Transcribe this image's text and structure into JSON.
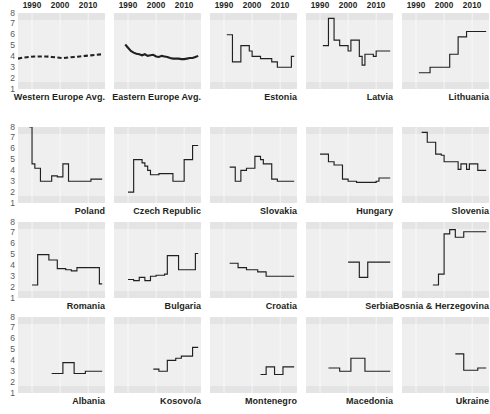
{
  "figure": {
    "kind": "small-multiples-line-chart-grid",
    "rows": 4,
    "columns": 5
  },
  "axes": {
    "y_ticks": [
      "8",
      "7",
      "6",
      "5",
      "4",
      "3",
      "2",
      "1"
    ],
    "y_min": 1,
    "y_max": 8,
    "x_ticks": [
      "1990",
      "2000",
      "2010"
    ],
    "x_min": 1985,
    "x_max": 2016
  },
  "chart_data": {
    "type": "line",
    "title": "",
    "subtitle": "",
    "xlabel": "",
    "ylabel": "",
    "xlim": [
      1985,
      2016
    ],
    "ylim": [
      1,
      8
    ],
    "grid": true,
    "legend": "none",
    "xticks": [
      1990,
      2000,
      2010
    ],
    "yticks": [
      1,
      2,
      3,
      4,
      5,
      6,
      7,
      8
    ],
    "panel_layout": [
      [
        "Western Europe Avg.",
        "Eastern Europe Avg.",
        "Estonia",
        "Latvia",
        "Lithuania"
      ],
      [
        "Poland",
        "Czech Republic",
        "Slovakia",
        "Hungary",
        "Slovenia"
      ],
      [
        "Romania",
        "Bulgaria",
        "Croatia",
        "Serbia",
        "Bosnia & Herzegovina"
      ],
      [
        "Albania",
        "Kosovo/a",
        "Montenegro",
        "Macedonia",
        "Ukraine"
      ]
    ],
    "panels": [
      {
        "name": "Western Europe Avg.",
        "style": "dashed",
        "x": [
          1985,
          1987,
          1989,
          1991,
          1993,
          1995,
          1997,
          1999,
          2001,
          2003,
          2005,
          2007,
          2009,
          2011,
          2013,
          2015
        ],
        "values": [
          3.8,
          3.9,
          3.95,
          4.0,
          4.0,
          4.0,
          3.95,
          3.9,
          3.85,
          3.9,
          3.95,
          4.0,
          4.05,
          4.1,
          4.15,
          4.2
        ]
      },
      {
        "name": "Eastern Europe Avg.",
        "style": "thick",
        "x": [
          1989,
          1990,
          1991,
          1992,
          1993,
          1994,
          1995,
          1996,
          1997,
          1998,
          1999,
          2000,
          2001,
          2002,
          2003,
          2004,
          2005,
          2006,
          2007,
          2008,
          2009,
          2010,
          2011,
          2012,
          2013,
          2014,
          2015
        ],
        "values": [
          5.1,
          4.8,
          4.5,
          4.35,
          4.25,
          4.2,
          4.1,
          4.2,
          4.05,
          4.1,
          4.15,
          4.0,
          3.95,
          4.05,
          4.0,
          3.95,
          3.85,
          3.8,
          3.8,
          3.8,
          3.75,
          3.75,
          3.8,
          3.85,
          3.85,
          3.95,
          4.05
        ]
      },
      {
        "name": "Estonia",
        "style": "thin",
        "x": [
          1991,
          1992,
          1993,
          1994,
          1995,
          1996,
          1997,
          1998,
          1999,
          2000,
          2001,
          2002,
          2003,
          2004,
          2005,
          2006,
          2007,
          2008,
          2009,
          2010,
          2011,
          2012,
          2013,
          2014,
          2015
        ],
        "values": [
          6.0,
          6.0,
          3.5,
          3.5,
          3.5,
          5.0,
          5.0,
          5.0,
          4.5,
          4.0,
          4.0,
          4.0,
          3.8,
          3.8,
          3.8,
          3.8,
          3.5,
          3.5,
          3.0,
          3.0,
          3.0,
          3.0,
          3.0,
          4.0,
          4.0
        ]
      },
      {
        "name": "Latvia",
        "style": "thin",
        "x": [
          1991,
          1992,
          1993,
          1994,
          1995,
          1996,
          1997,
          1998,
          1999,
          2000,
          2001,
          2002,
          2003,
          2004,
          2005,
          2006,
          2007,
          2008,
          2009,
          2010,
          2011,
          2012,
          2013,
          2014,
          2015
        ],
        "values": [
          5.0,
          5.0,
          7.5,
          7.5,
          5.5,
          5.5,
          5.0,
          5.0,
          5.0,
          4.5,
          5.5,
          5.5,
          5.5,
          4.0,
          3.2,
          4.2,
          4.2,
          4.2,
          4.0,
          4.5,
          4.5,
          4.5,
          4.5,
          4.5,
          4.5
        ]
      },
      {
        "name": "Lithuania",
        "style": "thin",
        "x": [
          1991,
          1992,
          1993,
          1994,
          1995,
          1996,
          1997,
          1998,
          1999,
          2000,
          2001,
          2002,
          2003,
          2004,
          2005,
          2006,
          2007,
          2008,
          2009,
          2010,
          2011,
          2012,
          2013,
          2014,
          2015
        ],
        "values": [
          2.5,
          2.5,
          2.5,
          2.5,
          3.0,
          3.0,
          3.0,
          3.0,
          3.0,
          3.0,
          3.0,
          4.2,
          4.2,
          4.2,
          5.8,
          5.8,
          5.8,
          6.3,
          6.3,
          6.3,
          6.3,
          6.3,
          6.3,
          6.3,
          6.3
        ]
      },
      {
        "name": "Poland",
        "style": "thin",
        "x": [
          1989,
          1990,
          1991,
          1992,
          1993,
          1994,
          1995,
          1996,
          1997,
          1998,
          1999,
          2000,
          2001,
          2002,
          2003,
          2004,
          2005,
          2006,
          2007,
          2008,
          2009,
          2010,
          2011,
          2012,
          2013,
          2014,
          2015
        ],
        "values": [
          8.0,
          4.6,
          4.2,
          4.2,
          3.0,
          3.0,
          3.0,
          3.0,
          3.5,
          3.5,
          3.4,
          3.4,
          4.6,
          4.6,
          3.0,
          3.0,
          3.0,
          3.0,
          3.0,
          3.0,
          3.0,
          3.0,
          3.2,
          3.2,
          3.2,
          3.2,
          3.2
        ]
      },
      {
        "name": "Czech Republic",
        "style": "thin",
        "x": [
          1990,
          1991,
          1992,
          1993,
          1994,
          1995,
          1996,
          1997,
          1998,
          1999,
          2000,
          2001,
          2002,
          2003,
          2004,
          2005,
          2006,
          2007,
          2008,
          2009,
          2010,
          2011,
          2012,
          2013,
          2014,
          2015
        ],
        "values": [
          2.0,
          2.0,
          5.0,
          5.0,
          5.0,
          4.7,
          4.4,
          4.0,
          3.6,
          3.6,
          3.6,
          3.7,
          3.7,
          3.7,
          3.7,
          3.7,
          3.0,
          3.0,
          3.0,
          3.0,
          5.0,
          5.0,
          5.0,
          6.3,
          6.3,
          6.3
        ]
      },
      {
        "name": "Slovakia",
        "style": "thin",
        "x": [
          1992,
          1993,
          1994,
          1995,
          1996,
          1997,
          1998,
          1999,
          2000,
          2001,
          2002,
          2003,
          2004,
          2005,
          2006,
          2007,
          2008,
          2009,
          2010,
          2011,
          2012,
          2013,
          2014,
          2015
        ],
        "values": [
          4.3,
          4.3,
          3.0,
          3.0,
          4.0,
          4.0,
          4.2,
          4.2,
          4.2,
          5.3,
          5.3,
          5.0,
          4.6,
          4.6,
          4.6,
          3.2,
          3.2,
          3.0,
          3.0,
          3.0,
          3.0,
          3.0,
          3.0,
          3.0
        ]
      },
      {
        "name": "Hungary",
        "style": "thin",
        "x": [
          1990,
          1991,
          1992,
          1993,
          1994,
          1995,
          1996,
          1997,
          1998,
          1999,
          2000,
          2001,
          2002,
          2003,
          2004,
          2005,
          2006,
          2007,
          2008,
          2009,
          2010,
          2011,
          2012,
          2013,
          2014,
          2015
        ],
        "values": [
          5.5,
          5.5,
          5.5,
          4.8,
          4.8,
          4.5,
          4.5,
          4.5,
          3.2,
          3.2,
          3.0,
          3.0,
          3.0,
          2.9,
          2.9,
          2.9,
          2.9,
          2.9,
          2.9,
          2.9,
          3.0,
          3.3,
          3.3,
          3.3,
          3.3,
          3.3
        ]
      },
      {
        "name": "Slovenia",
        "style": "thin",
        "x": [
          1992,
          1993,
          1994,
          1995,
          1996,
          1997,
          1998,
          1999,
          2000,
          2001,
          2002,
          2003,
          2004,
          2005,
          2006,
          2007,
          2008,
          2009,
          2010,
          2011,
          2012,
          2013,
          2014,
          2015
        ],
        "values": [
          7.5,
          7.5,
          6.6,
          6.6,
          6.6,
          5.5,
          5.5,
          5.4,
          4.8,
          4.8,
          4.8,
          4.8,
          4.8,
          4.1,
          4.6,
          4.6,
          4.1,
          4.6,
          4.6,
          4.6,
          4.0,
          4.0,
          4.0,
          4.0
        ]
      },
      {
        "name": "Romania",
        "style": "thin",
        "x": [
          1990,
          1991,
          1992,
          1993,
          1994,
          1995,
          1996,
          1997,
          1998,
          1999,
          2000,
          2001,
          2002,
          2003,
          2004,
          2005,
          2006,
          2007,
          2008,
          2009,
          2010,
          2011,
          2012,
          2013,
          2014,
          2015
        ],
        "values": [
          2.2,
          2.2,
          5.0,
          5.0,
          5.0,
          5.0,
          4.5,
          4.5,
          4.5,
          3.7,
          3.7,
          3.7,
          3.6,
          3.6,
          3.5,
          3.5,
          3.8,
          3.8,
          3.8,
          3.8,
          3.8,
          3.8,
          3.8,
          3.8,
          2.3,
          2.3
        ]
      },
      {
        "name": "Bulgaria",
        "style": "thin",
        "x": [
          1990,
          1991,
          1992,
          1993,
          1994,
          1995,
          1996,
          1997,
          1998,
          1999,
          2000,
          2001,
          2002,
          2003,
          2004,
          2005,
          2006,
          2007,
          2008,
          2009,
          2010,
          2011,
          2012,
          2013,
          2014,
          2015
        ],
        "values": [
          2.7,
          2.7,
          2.6,
          2.6,
          2.9,
          2.9,
          2.6,
          2.6,
          3.0,
          3.0,
          3.1,
          3.1,
          3.1,
          3.2,
          4.9,
          4.9,
          4.9,
          4.9,
          3.6,
          3.6,
          3.6,
          3.6,
          3.6,
          3.6,
          5.1,
          5.1
        ]
      },
      {
        "name": "Croatia",
        "style": "thin",
        "x": [
          1992,
          1993,
          1994,
          1995,
          1996,
          1997,
          1998,
          1999,
          2000,
          2001,
          2002,
          2003,
          2004,
          2005,
          2006,
          2007,
          2008,
          2009,
          2010,
          2011,
          2012,
          2013,
          2014,
          2015
        ],
        "values": [
          4.2,
          4.2,
          4.2,
          3.8,
          3.8,
          3.8,
          3.6,
          3.6,
          3.6,
          3.6,
          3.4,
          3.4,
          3.4,
          3.0,
          3.0,
          3.0,
          3.0,
          3.0,
          3.0,
          3.0,
          3.0,
          3.0,
          3.0,
          3.0
        ]
      },
      {
        "name": "Serbia",
        "style": "thin",
        "x": [
          2000,
          2001,
          2002,
          2003,
          2004,
          2005,
          2006,
          2007,
          2008,
          2009,
          2010,
          2011,
          2012,
          2013,
          2014,
          2015
        ],
        "values": [
          4.3,
          4.3,
          4.3,
          4.3,
          2.9,
          2.9,
          2.9,
          4.3,
          4.3,
          4.3,
          4.3,
          4.3,
          4.3,
          4.3,
          4.3,
          4.3
        ]
      },
      {
        "name": "Bosnia & Herzegovina",
        "style": "thin",
        "x": [
          1996,
          1997,
          1998,
          1999,
          2000,
          2001,
          2002,
          2003,
          2004,
          2005,
          2006,
          2007,
          2008,
          2009,
          2010,
          2011,
          2012,
          2013,
          2014,
          2015
        ],
        "values": [
          2.2,
          2.2,
          3.2,
          3.2,
          6.9,
          6.9,
          7.3,
          7.3,
          6.6,
          6.6,
          6.6,
          7.1,
          7.1,
          7.1,
          7.1,
          7.1,
          7.1,
          7.1,
          7.1,
          7.1
        ]
      },
      {
        "name": "Albania",
        "style": "thin",
        "x": [
          1997,
          1998,
          1999,
          2000,
          2001,
          2002,
          2003,
          2004,
          2005,
          2006,
          2007,
          2008,
          2009,
          2010,
          2011,
          2012,
          2013,
          2014,
          2015
        ],
        "values": [
          2.8,
          2.8,
          2.8,
          2.8,
          3.8,
          3.8,
          3.8,
          3.8,
          2.8,
          2.8,
          2.8,
          2.8,
          3.0,
          3.0,
          3.0,
          3.0,
          3.0,
          3.0,
          3.0
        ]
      },
      {
        "name": "Kosovo/a",
        "style": "thin",
        "x": [
          1999,
          2000,
          2001,
          2002,
          2003,
          2004,
          2005,
          2006,
          2007,
          2008,
          2009,
          2010,
          2011,
          2012,
          2013,
          2014,
          2015
        ],
        "values": [
          3.2,
          3.2,
          3.0,
          3.0,
          3.0,
          4.0,
          4.0,
          4.0,
          4.2,
          4.2,
          4.4,
          4.4,
          4.4,
          4.4,
          5.2,
          5.2,
          5.2
        ]
      },
      {
        "name": "Montenegro",
        "style": "thin",
        "x": [
          2003,
          2004,
          2005,
          2006,
          2007,
          2008,
          2009,
          2010,
          2011,
          2012,
          2013,
          2014,
          2015
        ],
        "values": [
          2.7,
          2.7,
          3.4,
          3.4,
          3.4,
          2.7,
          2.7,
          2.7,
          3.4,
          3.4,
          3.4,
          3.4,
          3.4
        ]
      },
      {
        "name": "Macedonia",
        "style": "thin",
        "x": [
          1993,
          1994,
          1995,
          1996,
          1997,
          1998,
          1999,
          2000,
          2001,
          2002,
          2003,
          2004,
          2005,
          2006,
          2007,
          2008,
          2009,
          2010,
          2011,
          2012,
          2013,
          2014,
          2015
        ],
        "values": [
          3.3,
          3.3,
          3.3,
          3.3,
          3.0,
          3.0,
          3.0,
          3.0,
          4.2,
          4.2,
          4.2,
          4.2,
          4.2,
          3.0,
          3.0,
          3.0,
          3.0,
          3.0,
          3.0,
          3.0,
          3.0,
          3.0,
          3.0
        ]
      },
      {
        "name": "Ukraine",
        "style": "thin",
        "x": [
          2004,
          2005,
          2006,
          2007,
          2008,
          2009,
          2010,
          2011,
          2012,
          2013,
          2014,
          2015
        ],
        "values": [
          4.6,
          4.6,
          4.6,
          3.1,
          3.1,
          3.1,
          3.1,
          3.1,
          3.3,
          3.3,
          3.3,
          3.3
        ]
      }
    ]
  }
}
